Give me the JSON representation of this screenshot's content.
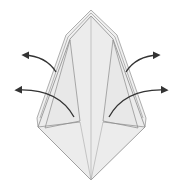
{
  "diagram": {
    "type": "origami-fold-diagram",
    "colors": {
      "paper": "#ececec",
      "edge": "#8a8a8a",
      "crease": "#a8a8a8",
      "arrow": "#333333",
      "background": "#ffffff"
    },
    "arrows": [
      {
        "id": "left-upper",
        "direction": "out-left"
      },
      {
        "id": "left-lower",
        "direction": "out-left"
      },
      {
        "id": "right-upper",
        "direction": "out-right"
      },
      {
        "id": "right-lower",
        "direction": "out-right"
      }
    ]
  }
}
